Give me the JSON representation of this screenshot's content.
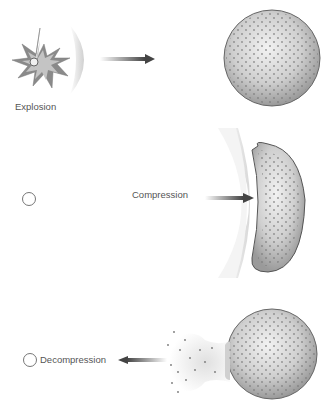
{
  "diagram": {
    "panels": [
      {
        "id": "explosion",
        "label": "Explosion"
      },
      {
        "id": "compression",
        "label": "Compression"
      },
      {
        "id": "decompression",
        "label": "Decompression"
      }
    ],
    "colors": {
      "arrow": "#555555",
      "body_fill": "#c8c8c8",
      "body_stroke": "#666666",
      "dots": "#888888",
      "star_outer": "#8a8a8a",
      "star_inner": "#bdbdbd"
    }
  }
}
